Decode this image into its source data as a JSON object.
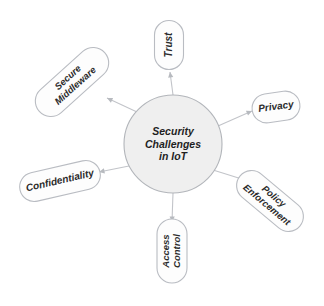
{
  "diagram": {
    "type": "hub-and-spoke",
    "center": {
      "id": "center-node",
      "lines": [
        "Security",
        "Challenges",
        "in IoT"
      ],
      "shape": "circle",
      "cx": 173,
      "cy": 144,
      "r": 49,
      "fill": "#efefef",
      "stroke": "#b2b5ba"
    },
    "colors": {
      "background": "#ffffff",
      "node_fill": "#fdfdfd",
      "node_stroke": "#b9bcc2",
      "center_fill": "#efefef",
      "center_stroke": "#b2b5ba",
      "connector": "#c2c4c9",
      "text": "#2b2b2b"
    },
    "nodes": [
      {
        "id": "node-trust",
        "label": "Trust",
        "lines": [
          "Trust"
        ],
        "cx": 169,
        "cy": 45,
        "w": 49,
        "h": 29,
        "shape_rotation": 90,
        "text_rotation": -90,
        "font_size": 10,
        "edge_from": [
          173,
          95
        ],
        "edge_to": [
          170,
          72
        ]
      },
      {
        "id": "node-privacy",
        "label": "Privacy",
        "lines": [
          "Privacy"
        ],
        "cx": 276,
        "cy": 107,
        "w": 48,
        "h": 29,
        "shape_rotation": -8,
        "text_rotation": -8,
        "font_size": 10,
        "edge_from": [
          218,
          126
        ],
        "edge_to": [
          252,
          111
        ]
      },
      {
        "id": "node-policy-enforcement",
        "label": "Policy Enforcement",
        "lines": [
          "Policy",
          "Enforcement"
        ],
        "cx": 270,
        "cy": 201,
        "w": 78,
        "h": 30,
        "shape_rotation": 40,
        "text_rotation": 40,
        "font_size": 9.5,
        "edge_from": [
          213,
          170
        ],
        "edge_to": [
          245,
          180
        ]
      },
      {
        "id": "node-access-control",
        "label": "Access Control",
        "lines": [
          "Access",
          "Control"
        ],
        "cx": 172,
        "cy": 251,
        "w": 64,
        "h": 30,
        "shape_rotation": 90,
        "text_rotation": -90,
        "font_size": 9.5,
        "edge_from": [
          173,
          193
        ],
        "edge_to": [
          172,
          222
        ]
      },
      {
        "id": "node-confidentiality",
        "label": "Confidentiality",
        "lines": [
          "Confidentiality"
        ],
        "cx": 60,
        "cy": 181,
        "w": 82,
        "h": 29,
        "shape_rotation": -13,
        "text_rotation": -13,
        "font_size": 10,
        "edge_from": [
          129,
          166
        ],
        "edge_to": [
          99,
          172
        ]
      },
      {
        "id": "node-secure-middleware",
        "label": "Secure Middleware",
        "lines": [
          "Secure",
          "Middleware"
        ],
        "cx": 72,
        "cy": 82,
        "w": 88,
        "h": 31,
        "shape_rotation": -42,
        "text_rotation": -42,
        "font_size": 9.5,
        "edge_from": [
          137,
          112
        ],
        "edge_to": [
          107,
          98
        ]
      }
    ]
  }
}
